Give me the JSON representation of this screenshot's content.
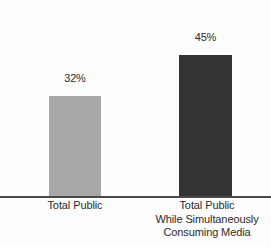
{
  "chart_data": {
    "type": "bar",
    "title": "",
    "subtitle": "",
    "xlabel": "",
    "ylabel": "",
    "ylim": [
      0,
      63
    ],
    "grid": false,
    "legend": "none",
    "orientation": "vertical",
    "value_label_position": "above-bar",
    "axis": {
      "baseline_shown": true,
      "y_axis_shown": false,
      "tick_marks": false
    },
    "categories": [
      "Total Public",
      "Total Public While Simultaneously Consuming Media"
    ],
    "category_lines": [
      [
        "Total Public"
      ],
      [
        "Total Public",
        "While Simultaneously",
        "Consuming Media"
      ]
    ],
    "values": [
      32,
      45
    ],
    "value_labels": [
      "32%",
      "45%"
    ],
    "colors": [
      "#a8a8a8",
      "#333333"
    ],
    "background_color": "#fdfdfd",
    "axis_color": "#4a4a4a",
    "text_color": "#2b2b2b"
  }
}
